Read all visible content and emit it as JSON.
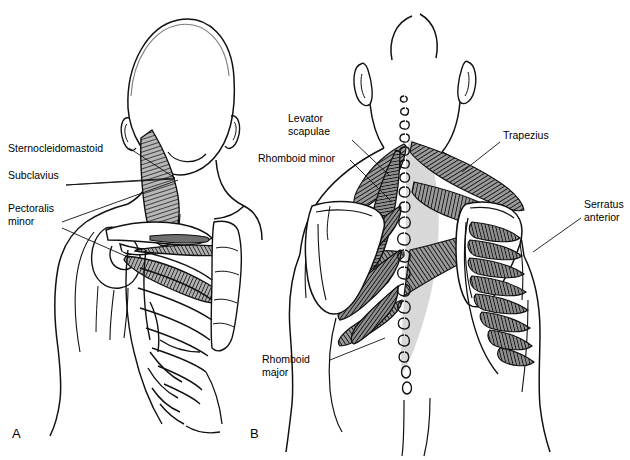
{
  "figure": {
    "background_color": "#ffffff",
    "line_color": "#000000",
    "muscle_fill": "#8a8a8a",
    "aponeurosis_fill": "#d8d8d8",
    "bone_fill": "#ffffff"
  },
  "panels": [
    {
      "id": "A",
      "letter": "A",
      "view": "anterior",
      "letter_pos": {
        "x": 12,
        "y": 438
      }
    },
    {
      "id": "B",
      "letter": "B",
      "view": "posterior",
      "letter_pos": {
        "x": 250,
        "y": 438
      }
    }
  ],
  "labels": [
    {
      "id": "sternocleidomastoid",
      "panel": "A",
      "lines": [
        "Sternocleidomastoid"
      ],
      "x": 8,
      "y": 152,
      "anchor": "start",
      "leaders": [
        [
          [
            129,
            148
          ],
          [
            175,
            178
          ]
        ]
      ]
    },
    {
      "id": "subclavius",
      "panel": "A",
      "lines": [
        "Subclavius"
      ],
      "x": 8,
      "y": 179,
      "anchor": "start",
      "leaders": [
        [
          [
            66,
            185
          ],
          [
            175,
            178
          ]
        ],
        [
          [
            66,
            185
          ],
          [
            175,
            179
          ]
        ]
      ]
    },
    {
      "id": "pectoralis-minor",
      "panel": "A",
      "lines": [
        "Pectoralis",
        "minor"
      ],
      "x": 8,
      "y": 212,
      "anchor": "start",
      "leaders": [
        [
          [
            62,
            222
          ],
          [
            178,
            180
          ]
        ],
        [
          [
            62,
            228
          ],
          [
            130,
            258
          ]
        ]
      ]
    },
    {
      "id": "levator-scapulae",
      "panel": "B",
      "lines": [
        "Levator",
        "scapulae"
      ],
      "x": 288,
      "y": 122,
      "anchor": "start",
      "leaders": [
        [
          [
            352,
            140
          ],
          [
            390,
            176
          ]
        ]
      ]
    },
    {
      "id": "rhomboid-minor",
      "panel": "B",
      "lines": [
        "Rhomboid minor"
      ],
      "x": 258,
      "y": 162,
      "anchor": "start",
      "leaders": [
        [
          [
            350,
            160
          ],
          [
            392,
            202
          ]
        ]
      ]
    },
    {
      "id": "trapezius",
      "panel": "B",
      "lines": [
        "Trapezius"
      ],
      "x": 503,
      "y": 139,
      "anchor": "start",
      "leaders": [
        [
          [
            500,
            142
          ],
          [
            462,
            172
          ]
        ]
      ]
    },
    {
      "id": "serratus-anterior",
      "panel": "B",
      "lines": [
        "Serratus",
        "anterior"
      ],
      "x": 584,
      "y": 208,
      "anchor": "start",
      "leaders": [
        [
          [
            581,
            218
          ],
          [
            533,
            252
          ]
        ]
      ]
    },
    {
      "id": "rhomboid-major",
      "panel": "B",
      "lines": [
        "Rhomboid",
        "major"
      ],
      "x": 262,
      "y": 363,
      "anchor": "start",
      "leaders": [
        [
          [
            330,
            360
          ],
          [
            385,
            338
          ]
        ]
      ]
    }
  ],
  "credit": {
    "text": "",
    "visible": false
  }
}
